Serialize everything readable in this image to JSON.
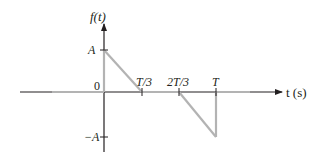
{
  "figure": {
    "y_axis_label": "f(t)",
    "x_axis_label": "t (s)",
    "y_ticks": {
      "top": "A",
      "zero": "0",
      "bottom": "−A"
    },
    "x_ticks": [
      "T/3",
      "2T/3",
      "T"
    ]
  },
  "colors": {
    "axis": "#231f20",
    "function_line": "#b3b3b3"
  },
  "signal": {
    "description": "Piecewise-linear periodic signal over one period",
    "segments": [
      {
        "from": "0",
        "to": "T/3",
        "shape": "linear ramp from A down to 0"
      },
      {
        "from": "T/3",
        "to": "2T/3",
        "shape": "zero"
      },
      {
        "from": "2T/3",
        "to": "T",
        "shape": "linear ramp from 0 down to −A, then jump back to 0"
      }
    ]
  }
}
